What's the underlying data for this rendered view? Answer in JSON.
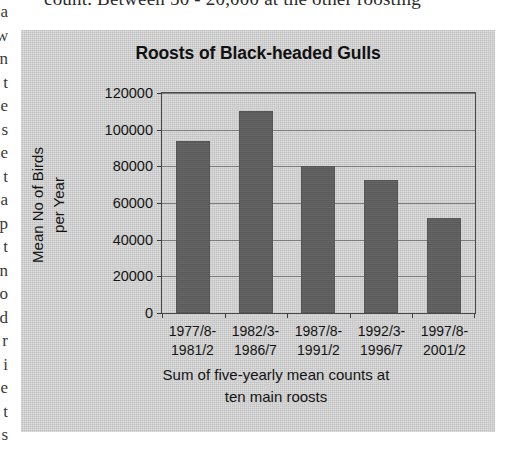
{
  "page": {
    "clipped_text_top": "count. Between 50 - 20,000 at the other roosting",
    "clipped_text_left": "a w n t e s e t a p t n o d"
  },
  "chart_data": {
    "type": "bar",
    "title": "Roosts of Black-headed Gulls",
    "xlabel_line1": "Sum of five-yearly mean counts at",
    "xlabel_line2": "ten main roosts",
    "ylabel_line1": "Mean No of Birds",
    "ylabel_line2": "per Year",
    "categories": [
      "1977/8-\n1981/2",
      "1982/3-\n1986/7",
      "1987/8-\n1991/2",
      "1992/3-\n1996/7",
      "1997/8-\n2001/2"
    ],
    "category_lines": [
      [
        "1977/8-",
        "1981/2"
      ],
      [
        "1982/3-",
        "1986/7"
      ],
      [
        "1987/8-",
        "1991/2"
      ],
      [
        "1992/3-",
        "1996/7"
      ],
      [
        "1997/8-",
        "2001/2"
      ]
    ],
    "values": [
      94000,
      110000,
      80000,
      72500,
      52000
    ],
    "ylim": [
      0,
      120000
    ],
    "yticks": [
      0,
      20000,
      40000,
      60000,
      80000,
      100000,
      120000
    ],
    "ytick_labels": [
      "0",
      "20000",
      "40000",
      "60000",
      "80000",
      "100000",
      "120000"
    ],
    "grid": true,
    "legend": "none",
    "colors": {
      "bar": "#5e5e5e",
      "panel_background": "#c8c8c8",
      "axis": "#3d3d3d",
      "gridline": "#6f6f6f",
      "text": "#141414"
    }
  }
}
